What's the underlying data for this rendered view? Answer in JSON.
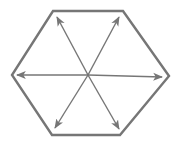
{
  "diagram": {
    "shape": "hexagon",
    "colors": {
      "stroke": "#767676",
      "background": "#ffffff"
    },
    "hexagon_points": [
      [
        53,
        11
      ],
      [
        123,
        11
      ],
      [
        169,
        76
      ],
      [
        120,
        135
      ],
      [
        52,
        135
      ],
      [
        12,
        75
      ]
    ],
    "center": [
      88,
      75
    ],
    "arrows": [
      {
        "name": "arrow-up-left",
        "to": [
          57,
          17
        ]
      },
      {
        "name": "arrow-up-right",
        "to": [
          119,
          17
        ]
      },
      {
        "name": "arrow-left",
        "to": [
          17,
          75
        ]
      },
      {
        "name": "arrow-right",
        "to": [
          162,
          77
        ]
      },
      {
        "name": "arrow-down-left",
        "to": [
          55,
          128
        ]
      },
      {
        "name": "arrow-down-right",
        "to": [
          119,
          129
        ]
      }
    ]
  }
}
